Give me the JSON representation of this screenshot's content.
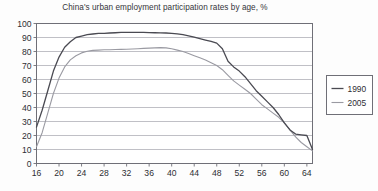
{
  "chart_data": {
    "type": "line",
    "title": "China's urban employment participation rates by age, %",
    "xlabel": "",
    "ylabel": "",
    "xlim": [
      16,
      65
    ],
    "ylim": [
      0,
      100
    ],
    "grid": true,
    "legend_position": "right",
    "y_ticks": [
      0,
      10,
      20,
      30,
      40,
      50,
      60,
      70,
      80,
      90,
      100
    ],
    "x_ticks": [
      16,
      20,
      24,
      28,
      32,
      36,
      40,
      44,
      48,
      52,
      56,
      60,
      64
    ],
    "x": [
      16,
      17,
      18,
      19,
      20,
      21,
      22,
      23,
      24,
      25,
      26,
      27,
      28,
      29,
      30,
      31,
      32,
      33,
      34,
      35,
      36,
      37,
      38,
      39,
      40,
      41,
      42,
      43,
      44,
      45,
      46,
      47,
      48,
      49,
      50,
      51,
      52,
      53,
      54,
      55,
      56,
      57,
      58,
      59,
      60,
      61,
      62,
      63,
      64,
      65
    ],
    "series": [
      {
        "name": "1990",
        "color": "#4a4a52",
        "values": [
          26,
          38,
          52,
          66,
          76,
          83,
          87,
          90,
          91,
          92,
          92.5,
          93,
          93,
          93.2,
          93.4,
          93.6,
          93.7,
          93.7,
          93.7,
          93.6,
          93.5,
          93.4,
          93.3,
          93.2,
          93,
          92.6,
          92,
          91.2,
          90.2,
          89.2,
          88.2,
          87.2,
          86,
          82,
          73,
          69,
          66,
          62,
          57,
          52,
          48,
          44,
          40,
          35,
          29,
          24,
          21,
          20.5,
          20,
          10
        ]
      },
      {
        "name": "2005",
        "color": "#9a9aa2",
        "values": [
          12,
          22,
          36,
          50,
          61,
          69,
          74,
          77,
          79,
          80.2,
          80.8,
          81,
          81.2,
          81.3,
          81.4,
          81.5,
          81.6,
          81.8,
          82,
          82.2,
          82.4,
          82.6,
          82.8,
          82.6,
          82,
          81,
          80,
          78.5,
          77,
          75.5,
          74,
          72,
          70,
          67,
          63,
          59,
          56,
          53,
          50,
          46,
          42,
          39,
          36,
          33,
          29,
          24,
          19,
          15,
          12,
          9
        ]
      }
    ]
  },
  "legend": {
    "entries": [
      {
        "label": "1990"
      },
      {
        "label": "2005"
      }
    ]
  }
}
